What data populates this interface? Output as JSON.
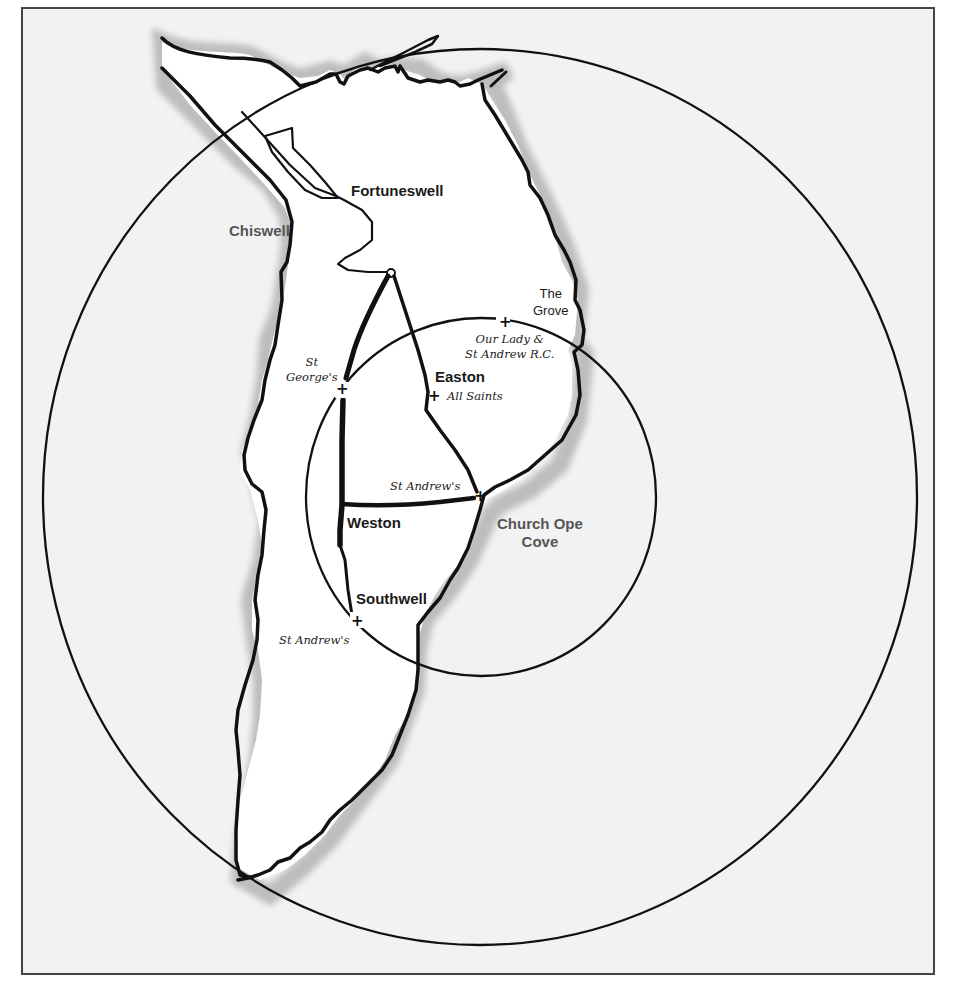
{
  "map": {
    "title": "",
    "colors": {
      "sea": "#f2f2f2",
      "land": "#ffffff",
      "coast_shadow": "#c8c8c8",
      "line": "#111111",
      "frame": "#444444"
    },
    "places": {
      "fortuneswell": "Fortuneswell",
      "chiswell": "Chiswell",
      "the_grove_line1": "The",
      "the_grove_line2": "Grove",
      "easton": "Easton",
      "weston": "Weston",
      "southwell": "Southwell",
      "church_ope_line1": "Church Ope",
      "church_ope_line2": "Cove"
    },
    "churches": {
      "st_georges_line1": "St",
      "st_georges_line2": "George's",
      "our_lady_line1": "Our Lady &",
      "our_lady_line2": "St Andrew R.C.",
      "all_saints": "All Saints",
      "st_andrews_east": "St Andrew's",
      "st_andrews_south": "St Andrew's"
    },
    "markers": {
      "cross_symbol": "+"
    },
    "circles": [
      {
        "name": "outer-radius",
        "cx": 480,
        "cy": 497,
        "rx": 437,
        "ry": 448
      },
      {
        "name": "inner-radius",
        "cx": 481,
        "cy": 497,
        "rx": 175,
        "ry": 179
      }
    ]
  }
}
